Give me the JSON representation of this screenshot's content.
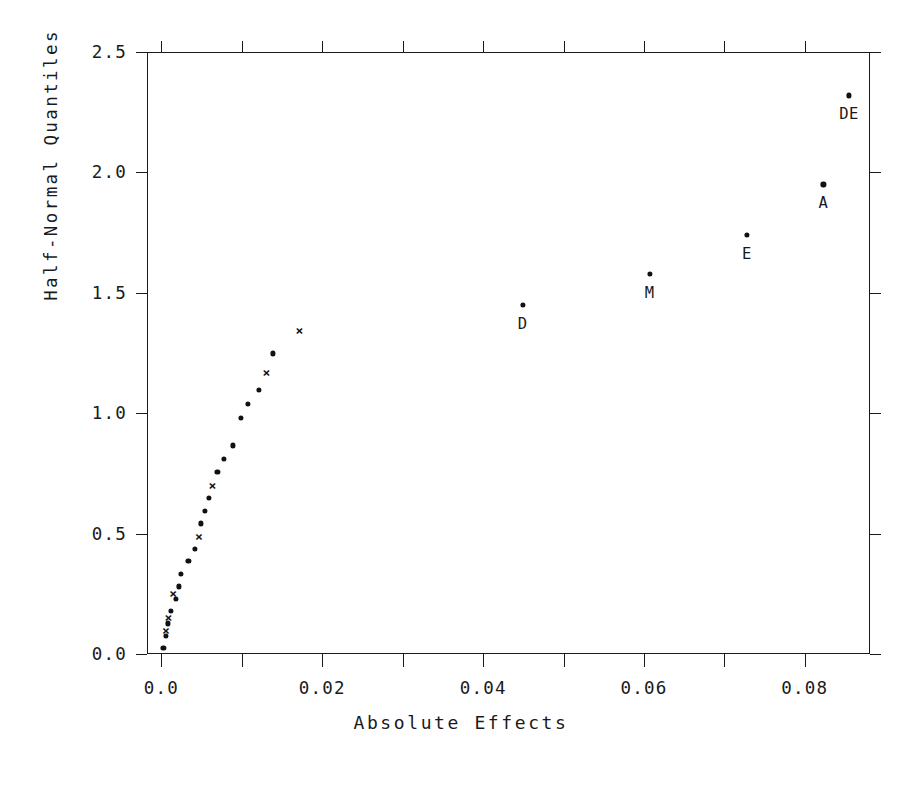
{
  "chart_data": {
    "type": "scatter",
    "title": "",
    "xlabel": "Absolute Effects",
    "ylabel": "Half-Normal Quantiles",
    "xlim": [
      -0.0018,
      0.0881
    ],
    "ylim": [
      0.0,
      2.5
    ],
    "grid": false,
    "legend": null,
    "xticks": [
      "0.0",
      "0.02",
      "0.04",
      "0.06",
      "0.08"
    ],
    "xtick_values": [
      0.0,
      0.02,
      0.04,
      0.06,
      0.08
    ],
    "xminor_values": [
      0.01,
      0.03,
      0.05,
      0.07
    ],
    "yticks": [
      "0.0",
      "0.5",
      "1.0",
      "1.5",
      "2.0",
      "2.5"
    ],
    "ytick_values": [
      0.0,
      0.5,
      1.0,
      1.5,
      2.0,
      2.5
    ],
    "series": [
      {
        "name": "unlabeled-effects-dot",
        "marker": "dot",
        "points": [
          {
            "x": 0.00025,
            "y": 0.025
          },
          {
            "x": 0.00055,
            "y": 0.075
          },
          {
            "x": 0.00085,
            "y": 0.127
          },
          {
            "x": 0.00115,
            "y": 0.178
          },
          {
            "x": 0.00175,
            "y": 0.229
          },
          {
            "x": 0.00215,
            "y": 0.281
          },
          {
            "x": 0.00245,
            "y": 0.333
          },
          {
            "x": 0.00335,
            "y": 0.385
          },
          {
            "x": 0.00415,
            "y": 0.437
          },
          {
            "x": 0.00495,
            "y": 0.542
          },
          {
            "x": 0.00545,
            "y": 0.595
          },
          {
            "x": 0.00585,
            "y": 0.648
          },
          {
            "x": 0.00695,
            "y": 0.756
          },
          {
            "x": 0.00775,
            "y": 0.811
          },
          {
            "x": 0.00885,
            "y": 0.866
          },
          {
            "x": 0.00985,
            "y": 0.979
          },
          {
            "x": 0.01075,
            "y": 1.037
          },
          {
            "x": 0.01215,
            "y": 1.096
          },
          {
            "x": 0.01385,
            "y": 1.248
          }
        ]
      },
      {
        "name": "unlabeled-effects-cross",
        "marker": "cross",
        "points": [
          {
            "x": 0.00055,
            "y": 0.1
          },
          {
            "x": 0.00085,
            "y": 0.152
          },
          {
            "x": 0.00145,
            "y": 0.255
          },
          {
            "x": 0.00465,
            "y": 0.49
          },
          {
            "x": 0.00635,
            "y": 0.7
          },
          {
            "x": 0.01305,
            "y": 1.17
          },
          {
            "x": 0.01715,
            "y": 1.345
          }
        ]
      },
      {
        "name": "labeled-effects",
        "marker": "dot",
        "points": [
          {
            "x": 0.0449,
            "y": 1.45,
            "label": "D"
          },
          {
            "x": 0.0607,
            "y": 1.58,
            "label": "M"
          },
          {
            "x": 0.0728,
            "y": 1.74,
            "label": "E"
          },
          {
            "x": 0.0823,
            "y": 1.95,
            "label": "A"
          },
          {
            "x": 0.0855,
            "y": 2.32,
            "label": "DE"
          }
        ]
      }
    ]
  },
  "colors": {
    "axis": "#1a1a1a",
    "marker": "#111111",
    "background": "#ffffff"
  }
}
